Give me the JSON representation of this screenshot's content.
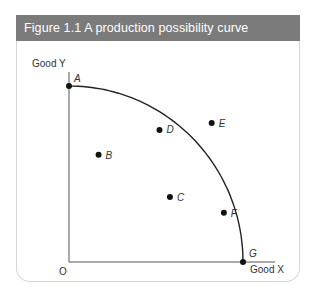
{
  "figure": {
    "title": "Figure 1.1  A production possibility curve"
  },
  "chart_data": {
    "type": "scatter",
    "title": "A production possibility curve",
    "xlabel": "Good X",
    "ylabel": "Good Y",
    "origin_label": "O",
    "grid": false,
    "xlim": [
      0,
      100
    ],
    "ylim": [
      0,
      100
    ],
    "curve": {
      "name": "production possibility curve",
      "from": "A",
      "to": "G",
      "through": [
        "D",
        "F"
      ]
    },
    "points": [
      {
        "label": "A",
        "x": 0,
        "y": 100,
        "on_curve": true
      },
      {
        "label": "B",
        "x": 17,
        "y": 61,
        "on_curve": false
      },
      {
        "label": "C",
        "x": 58,
        "y": 37,
        "on_curve": false
      },
      {
        "label": "D",
        "x": 52,
        "y": 75,
        "on_curve": true
      },
      {
        "label": "E",
        "x": 82,
        "y": 79,
        "on_curve": false
      },
      {
        "label": "F",
        "x": 89,
        "y": 28,
        "on_curve": true
      },
      {
        "label": "G",
        "x": 100,
        "y": 0,
        "on_curve": true
      }
    ]
  }
}
